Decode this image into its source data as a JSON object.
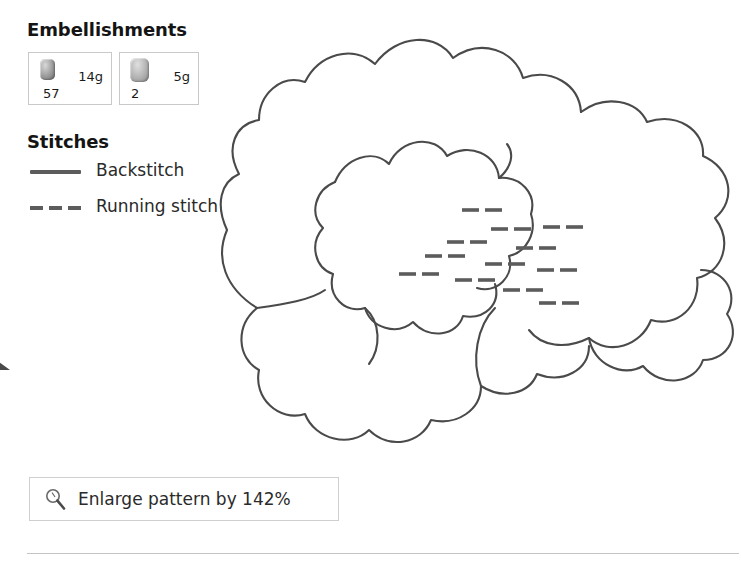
{
  "sections": {
    "embellishments": {
      "heading": "Embellishments",
      "items": [
        {
          "icon": "bead-icon",
          "weight": "14g",
          "count": "57"
        },
        {
          "icon": "bead-icon",
          "weight": "5g",
          "count": "2"
        }
      ]
    },
    "stitches": {
      "heading": "Stitches",
      "items": [
        {
          "style": "solid",
          "label": "Backstitch"
        },
        {
          "style": "dashed",
          "label": "Running stitch"
        }
      ]
    }
  },
  "enlarge": {
    "icon": "magnifier-icon",
    "label": "Enlarge pattern by 142%",
    "percent": "142%"
  },
  "pattern": {
    "name": "flower-pattern-outline",
    "stroke_color": "#4a4a4a",
    "stitch_color": "#5c5c5c",
    "background": "#ffffff"
  },
  "colors": {
    "line": "#4a4a4a",
    "box_border": "#c9c9c9",
    "rule": "#c4c4c4",
    "text": "#1a1a1a"
  }
}
